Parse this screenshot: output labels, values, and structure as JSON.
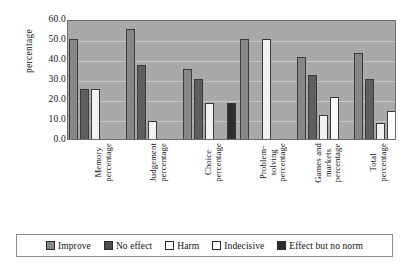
{
  "chart_data": {
    "type": "bar",
    "title": "",
    "xlabel": "",
    "ylabel": "percentage",
    "ylim": [
      0,
      60
    ],
    "ytick_step": 10,
    "ytick_labels": [
      "60.0",
      "50.0",
      "40.0",
      "30.0",
      "20.0",
      "10.0",
      "0.0"
    ],
    "grid": true,
    "legend_position": "bottom",
    "categories": [
      "Memory percentage",
      "Judgement percentage",
      "Problem-solving percentage",
      "Choice percentage",
      "Games and markets percentage",
      "Total percentage"
    ],
    "category_lines": [
      [
        "Memory",
        "percentage"
      ],
      [
        "Judgement",
        "percentage"
      ],
      [
        "Choice",
        "percentage"
      ],
      [
        "Problem-",
        "solving",
        "percentage"
      ],
      [
        "Games and",
        "markets",
        "percentage"
      ],
      [
        "Total",
        "percentage"
      ]
    ],
    "series": [
      {
        "name": "Improve",
        "color": "#878787",
        "values": [
          50,
          55,
          35,
          50,
          41,
          43
        ]
      },
      {
        "name": "No effect",
        "color": "#5e5e5e",
        "values": [
          25,
          37,
          30,
          null,
          32,
          30
        ]
      },
      {
        "name": "Harm",
        "color": "#f2f2f2",
        "values": [
          25,
          9,
          18,
          50,
          12,
          8
        ]
      },
      {
        "name": "Indecisive",
        "color": "#fbfbfb",
        "values": [
          null,
          null,
          null,
          null,
          21,
          14
        ]
      },
      {
        "name": "Effect but no norm",
        "color": "#2e2e2e",
        "values": [
          null,
          null,
          18,
          null,
          null,
          7
        ]
      }
    ]
  },
  "legend": {
    "items": [
      {
        "label": "Improve",
        "swatch": "legend-swatch-improve"
      },
      {
        "label": "No effect",
        "swatch": "legend-swatch-no-effect"
      },
      {
        "label": "Harm",
        "swatch": "legend-swatch-harm"
      },
      {
        "label": "Indecisive",
        "swatch": "legend-swatch-indecisive"
      },
      {
        "label": "Effect but no norm",
        "swatch": "legend-swatch-effect-but-no-norm"
      }
    ]
  }
}
